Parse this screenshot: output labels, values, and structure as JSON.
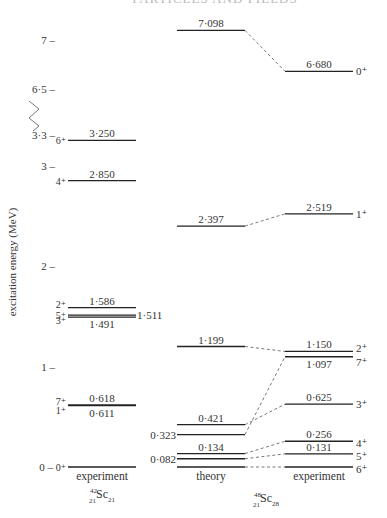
{
  "header_text": "PARTICLES AND FIELDS",
  "chart_data": {
    "type": "level-scheme",
    "ylabel": "excitation energy (MeV)",
    "axis_ticks": [
      {
        "value": 0,
        "label": "0 –"
      },
      {
        "value": 1,
        "label": "1 –"
      },
      {
        "value": 2,
        "label": "2 –"
      },
      {
        "value": 3,
        "label": "3 –"
      },
      {
        "value": 3.3,
        "label": "3·3 –"
      },
      {
        "value": 6.5,
        "label": "6·5 –"
      },
      {
        "value": 7,
        "label": "7 –"
      }
    ],
    "axis_break": {
      "from": 3.3,
      "to": 6.5
    },
    "columns": [
      {
        "id": "sc42-exp",
        "title": "experiment",
        "nucleus": {
          "A": "42",
          "Z": "21",
          "symbol": "Sc",
          "N": "21"
        },
        "levels": [
          {
            "energy": 0,
            "energy_label": "",
            "spin": "0⁺"
          },
          {
            "energy": 0.611,
            "energy_label": "0·611",
            "spin": "1⁺"
          },
          {
            "energy": 0.618,
            "energy_label": "0·618",
            "spin": "7⁺"
          },
          {
            "energy": 1.491,
            "energy_label": "1·491",
            "spin": "3⁺"
          },
          {
            "energy": 1.511,
            "energy_label": "1·511",
            "spin": "5⁺"
          },
          {
            "energy": 1.586,
            "energy_label": "1·586",
            "spin": "2⁺"
          },
          {
            "energy": 2.85,
            "energy_label": "2·850",
            "spin": "4⁺"
          },
          {
            "energy": 3.25,
            "energy_label": "3·250",
            "spin": "6⁺"
          }
        ]
      },
      {
        "id": "sc48-theory",
        "title": "theory",
        "levels": [
          {
            "energy": 0,
            "energy_label": ""
          },
          {
            "energy": 0.082,
            "energy_label": "0·082"
          },
          {
            "energy": 0.134,
            "energy_label": "0·134"
          },
          {
            "energy": 0.323,
            "energy_label": "0·323"
          },
          {
            "energy": 0.421,
            "energy_label": "0·421"
          },
          {
            "energy": 1.199,
            "energy_label": "1·199"
          },
          {
            "energy": 2.397,
            "energy_label": "2·397"
          },
          {
            "energy": 7.098,
            "energy_label": "7·098"
          }
        ]
      },
      {
        "id": "sc48-exp",
        "title": "experiment",
        "levels": [
          {
            "energy": 0,
            "energy_label": "",
            "spin": "6⁺"
          },
          {
            "energy": 0.131,
            "energy_label": "0·131",
            "spin": "5⁺"
          },
          {
            "energy": 0.256,
            "energy_label": "0·256",
            "spin": "4⁺"
          },
          {
            "energy": 0.625,
            "energy_label": "0·625",
            "spin": "3⁺"
          },
          {
            "energy": 1.097,
            "energy_label": "1·097",
            "spin": "7⁺"
          },
          {
            "energy": 1.15,
            "energy_label": "1·150",
            "spin": "2⁺"
          },
          {
            "energy": 2.519,
            "energy_label": "2·519",
            "spin": "1⁺"
          },
          {
            "energy": 6.68,
            "energy_label": "6·680",
            "spin": "0⁺"
          }
        ]
      }
    ],
    "sc48_nucleus": {
      "A": "48",
      "Z": "21",
      "symbol": "Sc",
      "N": "28"
    },
    "correspondences": [
      {
        "theory": 0,
        "experiment": 0
      },
      {
        "theory": 0.082,
        "experiment": 0.131
      },
      {
        "theory": 0.134,
        "experiment": 0.256
      },
      {
        "theory": 0.323,
        "experiment": 1.097
      },
      {
        "theory": 0.421,
        "experiment": 0.625
      },
      {
        "theory": 1.199,
        "experiment": 1.15
      },
      {
        "theory": 2.397,
        "experiment": 2.519
      },
      {
        "theory": 7.098,
        "experiment": 6.68
      }
    ]
  }
}
